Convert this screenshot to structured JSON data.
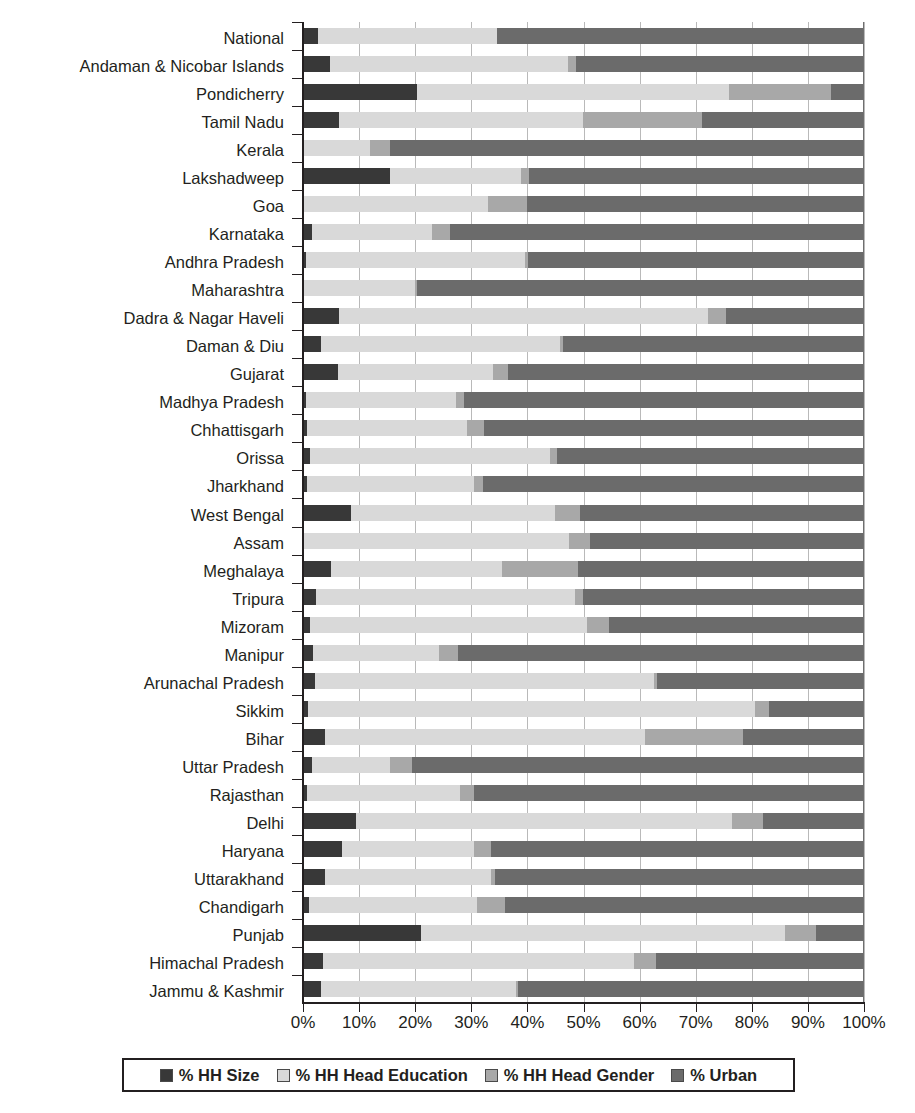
{
  "chart_data": {
    "type": "bar",
    "subtype": "stacked-horizontal-100pct",
    "title": "",
    "xlabel": "",
    "ylabel": "",
    "xlim": [
      0,
      100
    ],
    "xtick_labels": [
      "0%",
      "10%",
      "20%",
      "30%",
      "40%",
      "50%",
      "60%",
      "70%",
      "80%",
      "90%",
      "100%"
    ],
    "xticks": [
      0,
      10,
      20,
      30,
      40,
      50,
      60,
      70,
      80,
      90,
      100
    ],
    "grid": true,
    "grid_axis": "x",
    "legend_position": "bottom",
    "series": [
      {
        "name": "% HH Size",
        "color": "#383838"
      },
      {
        "name": "% HH Head Education",
        "color": "#d9d9d9"
      },
      {
        "name": "% HH Head Gender",
        "color": "#a8a8a8"
      },
      {
        "name": "% Urban",
        "color": "#6b6b6b"
      }
    ],
    "categories": [
      "National",
      "Andaman & Nicobar Islands",
      "Pondicherry",
      "Tamil Nadu",
      "Kerala",
      "Lakshadweep",
      "Goa",
      "Karnataka",
      "Andhra Pradesh",
      "Maharashtra",
      "Dadra & Nagar Haveli",
      "Daman & Diu",
      "Gujarat",
      "Madhya Pradesh",
      "Chhattisgarh",
      "Orissa",
      "Jharkhand",
      "West Bengal",
      "Assam",
      "Meghalaya",
      "Tripura",
      "Mizoram",
      "Manipur",
      "Arunachal Pradesh",
      "Sikkim",
      "Bihar",
      "Uttar Pradesh",
      "Rajasthan",
      "Delhi",
      "Haryana",
      "Uttarakhand",
      "Chandigarh",
      "Punjab",
      "Himachal Pradesh",
      "Jammu & Kashmir"
    ],
    "values": [
      [
        2.7,
        31.9,
        0.0,
        65.4
      ],
      [
        4.8,
        42.4,
        1.4,
        51.4
      ],
      [
        20.4,
        55.6,
        18.2,
        5.8
      ],
      [
        6.5,
        43.5,
        21.2,
        28.8
      ],
      [
        0.0,
        12.0,
        3.5,
        84.5
      ],
      [
        15.5,
        23.4,
        1.3,
        59.8
      ],
      [
        0.0,
        33.0,
        7.0,
        60.0
      ],
      [
        1.6,
        21.4,
        3.2,
        73.8
      ],
      [
        0.5,
        39.0,
        0.6,
        59.9
      ],
      [
        0.0,
        20.0,
        0.3,
        79.7
      ],
      [
        6.5,
        65.7,
        3.2,
        24.6
      ],
      [
        3.2,
        42.6,
        0.5,
        53.7
      ],
      [
        6.2,
        27.6,
        2.7,
        63.5
      ],
      [
        0.6,
        26.6,
        1.5,
        71.3
      ],
      [
        0.7,
        28.5,
        3.0,
        67.8
      ],
      [
        1.2,
        42.8,
        1.3,
        54.7
      ],
      [
        0.7,
        29.8,
        1.5,
        68.0
      ],
      [
        8.6,
        36.4,
        4.4,
        50.6
      ],
      [
        0.0,
        47.5,
        3.6,
        48.9
      ],
      [
        5.0,
        30.5,
        13.5,
        51.0
      ],
      [
        2.3,
        46.2,
        1.4,
        50.1
      ],
      [
        1.2,
        49.5,
        3.8,
        45.5
      ],
      [
        1.8,
        22.5,
        3.3,
        72.4
      ],
      [
        2.2,
        60.3,
        0.6,
        36.9
      ],
      [
        0.9,
        79.6,
        2.5,
        17.0
      ],
      [
        4.0,
        57.0,
        17.5,
        21.5
      ],
      [
        1.6,
        13.9,
        4.0,
        80.5
      ],
      [
        0.7,
        27.3,
        2.5,
        69.5
      ],
      [
        9.5,
        67.0,
        5.5,
        18.0
      ],
      [
        7.0,
        23.5,
        3.0,
        66.5
      ],
      [
        4.0,
        29.5,
        0.8,
        65.7
      ],
      [
        1.0,
        30.0,
        5.0,
        64.0
      ],
      [
        21.0,
        65.0,
        5.5,
        8.5
      ],
      [
        3.5,
        55.5,
        4.0,
        37.0
      ],
      [
        3.2,
        34.8,
        0.3,
        61.7
      ]
    ]
  },
  "legend": {
    "items": [
      {
        "label": "% HH Size",
        "color": "#383838"
      },
      {
        "label": "% HH Head Education",
        "color": "#d9d9d9"
      },
      {
        "label": "% HH Head Gender",
        "color": "#a8a8a8"
      },
      {
        "label": "% Urban",
        "color": "#6b6b6b"
      }
    ]
  }
}
